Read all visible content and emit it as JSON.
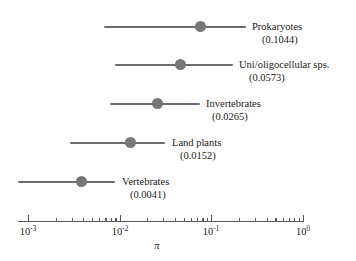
{
  "chart_data": {
    "type": "scatter",
    "title": "",
    "xlabel": "π",
    "ylabel": "",
    "xscale": "log",
    "xlim": [
      0.001,
      1.0
    ],
    "grid": false,
    "legend": false,
    "tick_labels": [
      "10⁻³",
      "10⁻²",
      "10⁻¹",
      "10⁰"
    ],
    "tick_exponents": [
      "-3",
      "-2",
      "-1",
      "0"
    ],
    "tick_mantissa": "10",
    "categories": [
      "Prokaryotes",
      "Uni/oligocellular sps.",
      "Invertebrates",
      "Land plants",
      "Vertebrates"
    ],
    "values": [
      0.1044,
      0.0573,
      0.0265,
      0.0152,
      0.0041
    ],
    "value_labels": [
      "(0.1044)",
      "(0.0573)",
      "(0.0265)",
      "(0.0152)",
      "(0.0041)"
    ],
    "ranges": [
      [
        0.0046,
        0.58
      ],
      [
        0.0077,
        0.33
      ],
      [
        0.0066,
        0.094
      ],
      [
        0.0022,
        0.036
      ],
      [
        0.00103,
        0.0175
      ]
    ],
    "point_color": "#777777",
    "line_color": "#6b6b6b"
  },
  "series": [
    {
      "label": "Prokaryotes",
      "value_label": "(0.1044)",
      "value": 0.1044,
      "low": 0.0046,
      "high": 0.58
    },
    {
      "label": "Uni/oligocellular sps.",
      "value_label": "(0.0573)",
      "value": 0.0573,
      "low": 0.0077,
      "high": 0.33
    },
    {
      "label": "Invertebrates",
      "value_label": "(0.0265)",
      "value": 0.0265,
      "low": 0.0066,
      "high": 0.094
    },
    {
      "label": "Land plants",
      "value_label": "(0.0152)",
      "value": 0.0152,
      "low": 0.0022,
      "high": 0.036
    },
    {
      "label": "Vertebrates",
      "value_label": "(0.0041)",
      "value": 0.0041,
      "low": 0.00103,
      "high": 0.0175
    }
  ],
  "axis": {
    "title": "π",
    "ticks": [
      {
        "mantissa": "10",
        "exponent": "-3"
      },
      {
        "mantissa": "10",
        "exponent": "-2"
      },
      {
        "mantissa": "10",
        "exponent": "-1"
      },
      {
        "mantissa": "10",
        "exponent": "0"
      }
    ]
  }
}
